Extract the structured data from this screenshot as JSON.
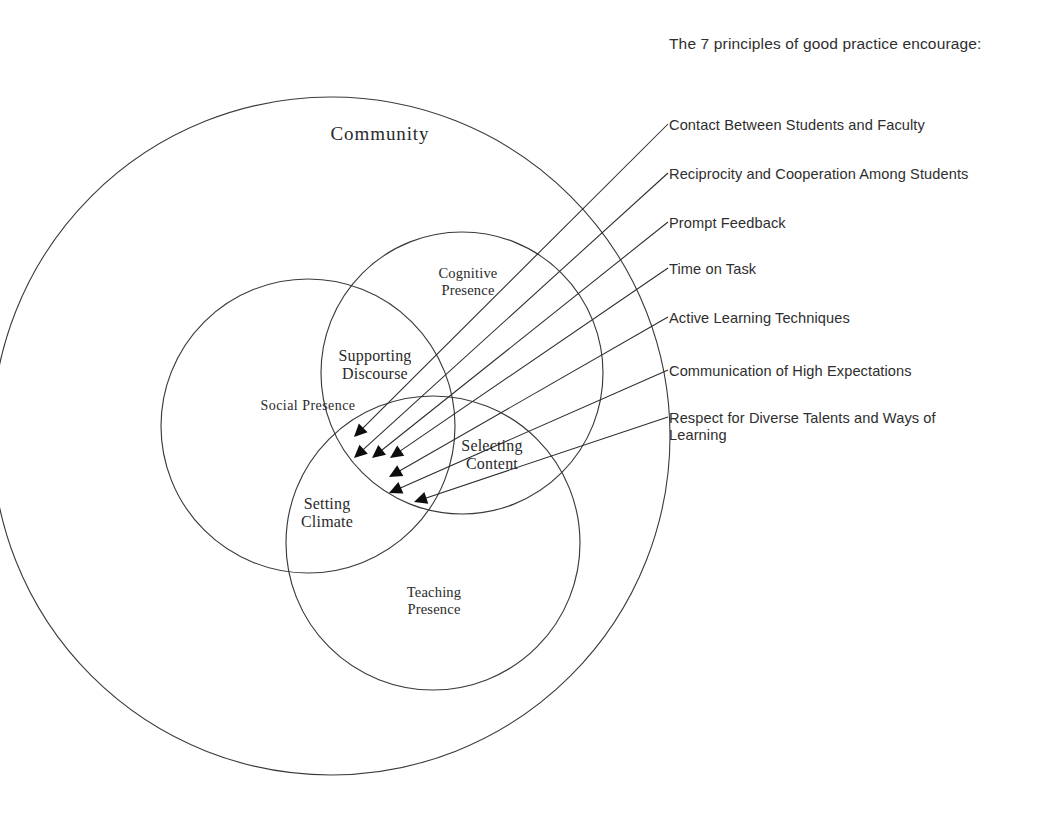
{
  "figure": {
    "kind": "venn-diagram-with-callouts",
    "background_color": "#ffffff",
    "line_color": "#2b2b2b"
  },
  "venn": {
    "outer": {
      "label": "Community",
      "cx": 331,
      "cy": 436,
      "r": 339
    },
    "circles": [
      {
        "id": "social",
        "label": "Social Presence",
        "cx": 308,
        "cy": 426,
        "r": 147
      },
      {
        "id": "cognitive",
        "label": "Cognitive\nPresence",
        "cx": 462,
        "cy": 373,
        "r": 141
      },
      {
        "id": "teaching",
        "label": "Teaching\nPresence",
        "cx": 433,
        "cy": 543,
        "r": 147
      }
    ],
    "overlaps": [
      {
        "id": "supporting-discourse",
        "label": "Supporting\nDiscourse"
      },
      {
        "id": "selecting-content",
        "label": "Selecting\nContent"
      },
      {
        "id": "setting-climate",
        "label": "Setting\nClimate"
      }
    ]
  },
  "principles": {
    "heading": "The 7 principles of good practice encourage:",
    "items": [
      {
        "index": 1,
        "label": "Contact Between Students and Faculty",
        "text_y": 117,
        "line_start_x": 668,
        "line_start_y": 124,
        "arrow_x": 354,
        "arrow_y": 437
      },
      {
        "index": 2,
        "label": "Reciprocity and Cooperation Among Students",
        "text_y": 166,
        "line_start_x": 668,
        "line_start_y": 173,
        "arrow_x": 354,
        "arrow_y": 458
      },
      {
        "index": 3,
        "label": "Prompt Feedback",
        "text_y": 215,
        "line_start_x": 668,
        "line_start_y": 222,
        "arrow_x": 372,
        "arrow_y": 458
      },
      {
        "index": 4,
        "label": "Time on Task",
        "text_y": 261,
        "line_start_x": 668,
        "line_start_y": 268,
        "arrow_x": 390,
        "arrow_y": 458
      },
      {
        "index": 5,
        "label": "Active Learning Techniques",
        "text_y": 310,
        "line_start_x": 668,
        "line_start_y": 317,
        "arrow_x": 389,
        "arrow_y": 477
      },
      {
        "index": 6,
        "label": "Communication of High Expectations",
        "text_y": 363,
        "line_start_x": 668,
        "line_start_y": 370,
        "arrow_x": 389,
        "arrow_y": 493
      },
      {
        "index": 7,
        "label": "Respect for Diverse Talents and Ways of\nLearning",
        "text_y": 410,
        "line_start_x": 668,
        "line_start_y": 417,
        "arrow_x": 414,
        "arrow_y": 502
      }
    ]
  },
  "label_positions": {
    "community": {
      "left": 290,
      "top": 123,
      "width": 180
    },
    "social_presence": {
      "left": 228,
      "top": 398,
      "width": 160
    },
    "cognitive_presence": {
      "left": 408,
      "top": 265,
      "width": 120
    },
    "teaching_presence": {
      "left": 374,
      "top": 584,
      "width": 120
    },
    "supporting_discourse": {
      "left": 310,
      "top": 347,
      "width": 130
    },
    "selecting_content": {
      "left": 432,
      "top": 437,
      "width": 120
    },
    "setting_climate": {
      "left": 272,
      "top": 495,
      "width": 110
    }
  }
}
